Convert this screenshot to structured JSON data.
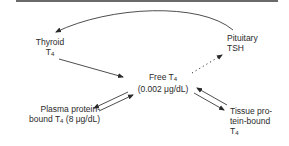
{
  "diagram": {
    "nodes": {
      "thyroid": {
        "line1": "Thyroid",
        "line2_main": "T",
        "line2_sub": "4"
      },
      "pituitary": {
        "line1": "Pituitary",
        "line2": "TSH"
      },
      "free_t4": {
        "line1_main": "Free T",
        "line1_sub": "4",
        "line2": "(0.002 μg/dL)"
      },
      "plasma_bound": {
        "line1": "Plasma protein-",
        "line2_pre": "bound T",
        "line2_sub": "4",
        "line2_post": " (8 μg/dL)"
      },
      "tissue_bound": {
        "line1": "Tissue pro-",
        "line2": "tein-bound",
        "line3_main": "T",
        "line3_sub": "4"
      }
    },
    "edges": [
      {
        "from": "pituitary",
        "to": "thyroid",
        "style": "solid-curved"
      },
      {
        "from": "thyroid",
        "to": "free_t4",
        "style": "solid"
      },
      {
        "from": "free_t4",
        "to": "pituitary",
        "style": "dotted"
      },
      {
        "from": "free_t4",
        "to": "plasma_bound",
        "style": "solid-reversible"
      },
      {
        "from": "free_t4",
        "to": "tissue_bound",
        "style": "solid-reversible"
      }
    ],
    "colors": {
      "line": "#3a3a3a",
      "text": "#2a2a2a",
      "rule": "#6a6a6a"
    }
  }
}
